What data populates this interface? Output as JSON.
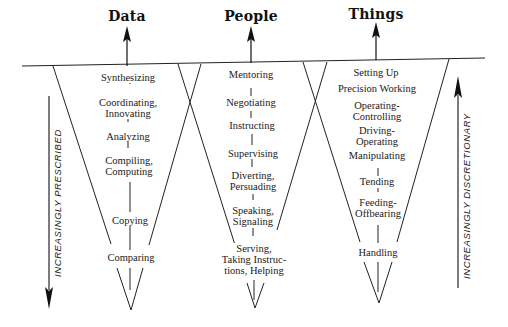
{
  "diagram": {
    "columns": [
      {
        "title": "Data",
        "items": [
          "Synthesizing",
          "Coordinating,\nInnovating",
          "Analyzing",
          "Compiling,\nComputing",
          "Copying",
          "Comparing"
        ]
      },
      {
        "title": "People",
        "items": [
          "Mentoring",
          "Negotiating",
          "Instructing",
          "Supervising",
          "Diverting,\nPersuading",
          "Speaking,\nSignaling",
          "Serving,\nTaking Instruc-\ntions, Helping"
        ]
      },
      {
        "title": "Things",
        "items": [
          "Setting Up",
          "Precision Working",
          "Operating-\nControlling",
          "Driving-\nOperating",
          "Manipulating",
          "Tending",
          "Feeding-\nOffbearing",
          "Handling"
        ]
      }
    ],
    "left_axis_label": "INCREASINGLY PRESCRIBED",
    "right_axis_label": "INCREASINGLY DISCRETIONARY",
    "colors": {
      "ink": "#1a1a1a",
      "background": "#ffffff"
    }
  }
}
